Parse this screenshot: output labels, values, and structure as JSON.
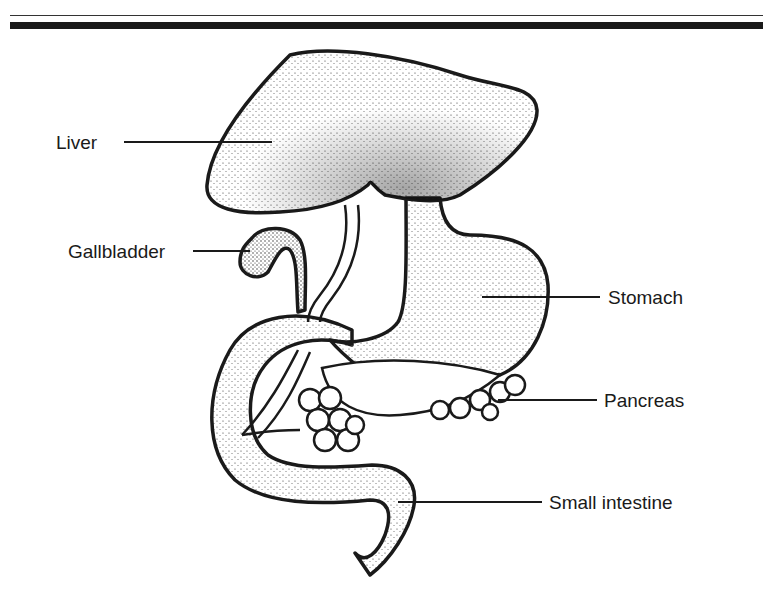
{
  "figure": {
    "type": "anatomical-diagram",
    "header_rules": [
      "thin",
      "thick"
    ]
  },
  "labels": {
    "liver": "Liver",
    "gallbladder": "Gallbladder",
    "stomach": "Stomach",
    "pancreas": "Pancreas",
    "small_intestine": "Small intestine"
  },
  "colors": {
    "ink": "#1a1a1a",
    "background": "#ffffff"
  }
}
